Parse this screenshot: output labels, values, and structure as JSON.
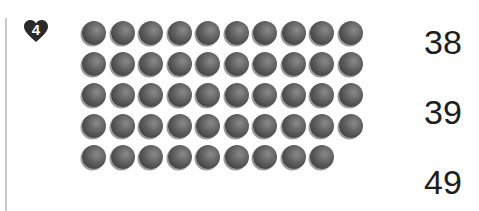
{
  "problem": {
    "number": "4",
    "badge_shape": "heart-icon",
    "badge_color": "#2a2a2a"
  },
  "dots": {
    "rows": [
      10,
      10,
      10,
      10,
      9
    ],
    "total": 49,
    "color": "#555555"
  },
  "choices": [
    "38",
    "39",
    "49"
  ]
}
